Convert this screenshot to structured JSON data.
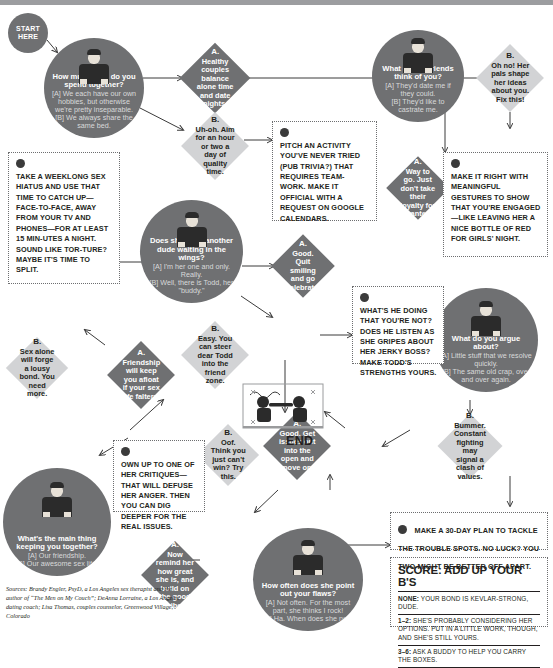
{
  "start_badge": "START HERE",
  "end_label": "END",
  "questions": [
    {
      "id": "q-time-together",
      "question": "How much time do you spend together?",
      "answer_a": "[A] We each have our own hobbies, but otherwise we're pretty inseparable.",
      "answer_b": "[B] We always share the same bed."
    },
    {
      "id": "q-friends-think",
      "question": "What do her friends think of you?",
      "answer_a": "[A] They'd date me if they could.",
      "answer_b": "[B] They'd like to castrate me."
    },
    {
      "id": "q-another-dude",
      "question": "Does she have another dude waiting in the wings?",
      "answer_a": "[A] I'm her one and only. Really.",
      "answer_b": "[B] Well, there is Todd, her \"buddy.\""
    },
    {
      "id": "q-argue-about",
      "question": "What do you argue about?",
      "answer_a": "[A] Little stuff that we resolve quickly.",
      "answer_b": "[B] The same old crap, over and over again."
    },
    {
      "id": "q-point-out-flaws",
      "question": "How often does she point out your flaws?",
      "answer_a": "[A] Not often. For the most part, she thinks I rock!",
      "answer_b": "[B] Ha. When does she not?"
    },
    {
      "id": "q-main-thing",
      "question": "What's the main thing keeping you together?",
      "answer_a": "[A] Our friendship.",
      "answer_b": "[B] Our awesome sex life."
    }
  ],
  "diamonds": [
    {
      "id": "d-healthy-couples",
      "label": "A.",
      "text": "Healthy couples balance alone time and date nights.",
      "tone": "dark"
    },
    {
      "id": "d-uh-oh",
      "label": "B.",
      "text": "Uh-oh. Aim for an hour or two a day of quality time.",
      "tone": "light"
    },
    {
      "id": "d-oh-no-pals",
      "label": "B.",
      "text": "Oh no! Her pals shape her ideas about you. Fix this!",
      "tone": "light"
    },
    {
      "id": "d-way-to-go",
      "label": "A.",
      "text": "Way to go. Just don't take their loyalty for granted.",
      "tone": "dark"
    },
    {
      "id": "d-friendship-afloat",
      "label": "A.",
      "text": "Friendship will keep you afloat if your sex life falters.",
      "tone": "dark"
    },
    {
      "id": "d-sex-alone",
      "label": "B.",
      "text": "Sex alone will forge a lousy bond. You need more.",
      "tone": "light"
    },
    {
      "id": "d-quit-smiling",
      "label": "A.",
      "text": "Good. Quit smiling and go celebrate.",
      "tone": "dark"
    },
    {
      "id": "d-steer-todd",
      "label": "B.",
      "text": "Easy. You can steer dear Todd into the friend zone.",
      "tone": "light"
    },
    {
      "id": "d-issues-open",
      "label": "A.",
      "text": "Good. Get issues out into the open and move on.",
      "tone": "dark"
    },
    {
      "id": "d-bummer-fighting",
      "label": "B.",
      "text": "Bummer. Constant fighting may signal a clash of values.",
      "tone": "light"
    },
    {
      "id": "d-remind-her",
      "label": "A.",
      "text": "Now remind her how great she is, and build on the good vibe.",
      "tone": "dark"
    },
    {
      "id": "d-oof-cant-win",
      "label": "B.",
      "text": "Oof. Think you just can't win? Try this.",
      "tone": "light"
    }
  ],
  "tips": [
    {
      "id": "tip-sex-hiatus",
      "text": "TAKE A WEEKLONG SEX HIATUS AND USE THAT TIME TO CATCH UP—FACE-TO-FACE, AWAY FROM YOUR TV AND PHONES—FOR AT LEAST 15 MIN-UTES A NIGHT. SOUND LIKE TOR-TURE? MAYBE IT'S TIME TO SPLIT."
    },
    {
      "id": "tip-pitch-activity",
      "text": "PITCH AN ACTIVITY YOU'VE NEVER TRIED (PUB TRIVIA?) THAT REQUIRES TEAM-WORK. MAKE IT OFFICIAL WITH A REQUEST ON GOOGLE CALENDARS."
    },
    {
      "id": "tip-make-it-right",
      "text": "MAKE IT RIGHT WITH MEANINGFUL GESTURES TO SHOW THAT YOU'RE ENGAGED—LIKE LEAVING HER A NICE BOTTLE OF RED FOR GIRLS' NIGHT."
    },
    {
      "id": "tip-todd-strengths",
      "text": "WHAT'S HE DOING THAT YOU'RE NOT? DOES HE LISTEN AS SHE GRIPES ABOUT HER JERKY BOSS? MAKE TODD'S STRENGTHS YOURS."
    },
    {
      "id": "tip-own-critiques",
      "text": "OWN UP TO ONE OF HER CRITIQUES—THAT WILL DEFUSE HER ANGER. THEN YOU CAN DIG DEEPER FOR THE REAL ISSUES."
    },
    {
      "id": "tip-30-day-plan",
      "text": "MAKE A 30-DAY PLAN TO TACKLE THE TROUBLE SPOTS. NO LUCK? YOU TWO MIGHT BE BETTER OFF APART."
    }
  ],
  "score": {
    "title": "SCORE: ADD UP YOUR B'S",
    "rows": [
      {
        "range": "NONE:",
        "text": "YOUR BOND IS KEVLAR-STRONG, DUDE."
      },
      {
        "range": "1–2:",
        "text": "SHE'S PROBABLY CONSIDERING HER OPTIONS. PUT IN A LITTLE WORK, THOUGH, AND SHE'S STILL YOURS."
      },
      {
        "range": "3–6:",
        "text": "ASK A BUDDY TO HELP YOU CARRY THE BOXES."
      }
    ]
  },
  "sources": "Sources: Brandy Engler, PsyD, a Los Angeles sex therapist and the author of “The Men on My Couch”; DeAnna Lorraine, a Los Angeles dating coach; Lisa Thomas, couples counselor, Greenwood Village, Colorado",
  "colors": {
    "dark_gray": "#6f7072",
    "light_gray": "#d2d3d5",
    "ink": "#231f20"
  }
}
